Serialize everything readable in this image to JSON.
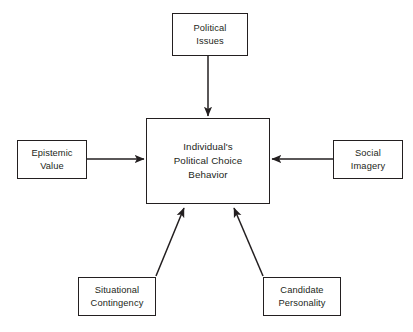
{
  "diagram": {
    "line_color": "#231f20",
    "background_color": "#ffffff",
    "nodes": {
      "center": {
        "label": "Individual's\nPolitical Choice\nBehavior",
        "role": "outcome"
      },
      "top": {
        "label": "Political\nIssues",
        "role": "determinant"
      },
      "left": {
        "label": "Epistemic\nValue",
        "role": "determinant"
      },
      "right": {
        "label": "Social\nImagery",
        "role": "determinant"
      },
      "bottom_left": {
        "label": "Situational\nContingency",
        "role": "determinant"
      },
      "bottom_right": {
        "label": "Candidate\nPersonality",
        "role": "determinant"
      }
    },
    "connectors": [
      {
        "name": "political-issues-to-center",
        "from": "top",
        "to": "center",
        "direction": "down",
        "style": "solid-single-arrow"
      },
      {
        "name": "epistemic-value-to-center",
        "from": "left",
        "to": "center",
        "direction": "right",
        "style": "solid-single-arrow"
      },
      {
        "name": "social-imagery-to-center",
        "from": "right",
        "to": "center",
        "direction": "left",
        "style": "solid-single-arrow"
      },
      {
        "name": "situational-contingency-to-center",
        "from": "bottom_left",
        "to": "center",
        "direction": "up-right",
        "style": "solid-single-arrow"
      },
      {
        "name": "candidate-personality-to-center",
        "from": "bottom_right",
        "to": "center",
        "direction": "up-left",
        "style": "solid-single-arrow"
      }
    ]
  }
}
